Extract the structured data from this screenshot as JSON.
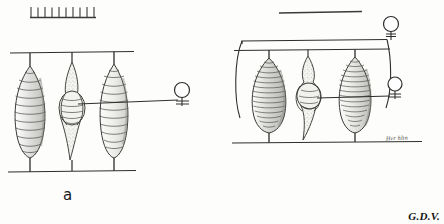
{
  "plate": {
    "title": "Cocoon suspension diagram plate",
    "signature": "G.D.V.",
    "ink_color": "#2b2b2b",
    "paper_color": "#fdfdfc"
  },
  "panels": [
    {
      "id": "a",
      "label": "a",
      "scale_bar": {
        "name": "ruler-scale-bar",
        "tick_count": 10,
        "orientation": "ticks-up"
      },
      "support_lines": {
        "top_label": "upper support line",
        "bottom_label": "lower support line"
      },
      "specimens": [
        {
          "name": "cocoon-left",
          "type": "banded-spindle-cocoon",
          "band_count": 14
        },
        {
          "name": "cocoon-middle",
          "type": "opened-cocoon-with-pupa",
          "band_count": 7
        },
        {
          "name": "cocoon-right",
          "type": "banded-spindle-cocoon",
          "band_count": 15
        }
      ],
      "instruments": [
        {
          "name": "bulb-probe-right",
          "type": "bulb-on-stem",
          "bulb_shape": "circle"
        }
      ]
    },
    {
      "id": "b",
      "label": "b",
      "scale_bar": {
        "name": "plain-scale-bar",
        "tick_count": 0,
        "orientation": "plain"
      },
      "annotation": "Hvr hltn",
      "support_lines": {
        "top_label": "upper support line",
        "bottom_label": "lower support line"
      },
      "specimens": [
        {
          "name": "cocoon-left",
          "type": "banded-ovoid-cocoon",
          "band_count": 20
        },
        {
          "name": "cocoon-middle",
          "type": "emerging-larva-with-cocoon",
          "band_count": 6
        },
        {
          "name": "cocoon-right",
          "type": "banded-ovoid-cocoon",
          "band_count": 18
        }
      ],
      "instruments": [
        {
          "name": "bulb-probe-top",
          "type": "bulb-on-stem",
          "bulb_shape": "circle"
        },
        {
          "name": "bulb-probe-bottom",
          "type": "bulb-on-stem",
          "bulb_shape": "circle"
        }
      ]
    }
  ]
}
